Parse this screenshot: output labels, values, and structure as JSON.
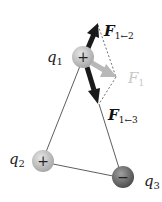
{
  "diagram": {
    "type": "coulomb-force-vector-diagram",
    "charges": [
      {
        "id": "q1",
        "label": "q",
        "subscript": "1",
        "sign": "+",
        "x": 83,
        "y": 57
      },
      {
        "id": "q2",
        "label": "q",
        "subscript": "2",
        "sign": "+",
        "x": 43,
        "y": 161
      },
      {
        "id": "q3",
        "label": "q",
        "subscript": "3",
        "sign": "−",
        "x": 123,
        "y": 177
      }
    ],
    "forces": [
      {
        "id": "F12",
        "label": "F",
        "subscript": "1←2",
        "color": "#1a1a1a"
      },
      {
        "id": "F13",
        "label": "F",
        "subscript": "1←3",
        "color": "#1a1a1a"
      },
      {
        "id": "F1",
        "label": "F",
        "subscript": "1",
        "color": "#b8b8b8"
      }
    ],
    "colors": {
      "positive_charge": "#c4c4c4",
      "negative_charge": "#7a7a7a",
      "force_arrow": "#1a1a1a",
      "net_force_arrow": "#b8b8b8",
      "net_force_label": "#c8c8c8"
    }
  }
}
